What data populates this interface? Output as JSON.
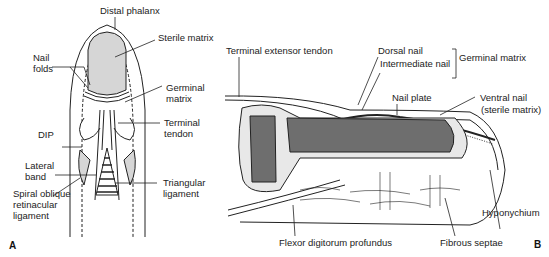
{
  "panel_a": {
    "letter": "A",
    "labels": {
      "distal_phalanx": "Distal phalanx",
      "sterile_matrix": "Sterile matrix",
      "nail_folds_1": "Nail",
      "nail_folds_2": "folds",
      "germinal_matrix_1": "Germinal",
      "germinal_matrix_2": "matrix",
      "terminal_tendon_1": "Terminal",
      "terminal_tendon_2": "tendon",
      "dip": "DIP",
      "lateral_band_1": "Lateral",
      "lateral_band_2": "band",
      "spiral_1": "Spiral oblique",
      "spiral_2": "retinacular",
      "spiral_3": "ligament",
      "triangular_1": "Triangular",
      "triangular_2": "ligament"
    }
  },
  "panel_b": {
    "letter": "B",
    "labels": {
      "terminal_extensor_tendon": "Terminal extensor tendon",
      "dorsal_nail": "Dorsal nail",
      "intermediate_nail": "Intermediate nail",
      "germinal_matrix": "Germinal matrix",
      "nail_plate": "Nail plate",
      "ventral_nail_1": "Ventral nail",
      "ventral_nail_2": "(sterile matrix)",
      "hyponychium": "Hyponychium",
      "flexor": "Flexor digitorum profundus",
      "fibrous_septae": "Fibrous septae"
    }
  }
}
